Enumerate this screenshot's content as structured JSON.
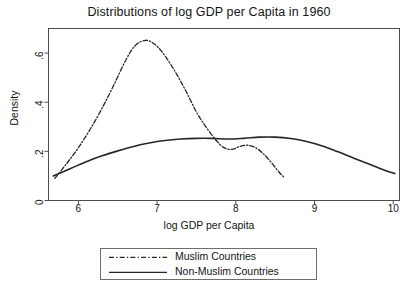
{
  "chart_data": {
    "type": "line",
    "title": "Distributions of log GDP per Capita in 1960",
    "xlabel": "log GDP per Capita",
    "ylabel": "Density",
    "xlim": [
      5.62,
      10.08
    ],
    "ylim": [
      0,
      0.7
    ],
    "grid": false,
    "legend_position": "below-plot-center",
    "xticks": [
      6,
      7,
      8,
      9,
      10
    ],
    "xticklabels": [
      "6",
      "7",
      "8",
      "9",
      "10"
    ],
    "yticks": [
      0,
      0.2,
      0.4,
      0.6
    ],
    "yticklabels": [
      "0",
      ".2",
      ".4",
      ".6"
    ],
    "series": [
      {
        "name": "Muslim Countries",
        "linestyle": "dash-dot",
        "color": "#262626",
        "x": [
          5.7,
          5.85,
          6.0,
          6.15,
          6.3,
          6.45,
          6.6,
          6.72,
          6.85,
          6.95,
          7.05,
          7.2,
          7.35,
          7.5,
          7.62,
          7.75,
          7.85,
          7.95,
          8.05,
          8.15,
          8.25,
          8.35,
          8.45,
          8.55,
          8.62
        ],
        "y": [
          0.09,
          0.15,
          0.215,
          0.29,
          0.375,
          0.47,
          0.57,
          0.63,
          0.652,
          0.64,
          0.61,
          0.54,
          0.455,
          0.36,
          0.3,
          0.245,
          0.215,
          0.208,
          0.22,
          0.225,
          0.215,
          0.19,
          0.155,
          0.115,
          0.092
        ]
      },
      {
        "name": "Non-Muslim Countries",
        "linestyle": "solid",
        "color": "#262626",
        "x": [
          5.68,
          5.9,
          6.1,
          6.3,
          6.5,
          6.7,
          6.9,
          7.1,
          7.3,
          7.5,
          7.7,
          7.9,
          8.1,
          8.3,
          8.5,
          8.7,
          8.9,
          9.1,
          9.3,
          9.5,
          9.7,
          9.9,
          10.02
        ],
        "y": [
          0.1,
          0.13,
          0.158,
          0.182,
          0.202,
          0.22,
          0.234,
          0.244,
          0.25,
          0.253,
          0.253,
          0.25,
          0.253,
          0.258,
          0.258,
          0.252,
          0.24,
          0.222,
          0.198,
          0.172,
          0.148,
          0.122,
          0.11
        ]
      }
    ]
  },
  "legend": {
    "entries": [
      {
        "label": "Muslim Countries",
        "style": "dash-dot"
      },
      {
        "label": "Non-Muslim Countries",
        "style": "solid"
      }
    ]
  },
  "colors": {
    "line": "#262626",
    "frame": "#4d4d4d",
    "text": "#141414",
    "background": "#ffffff"
  }
}
